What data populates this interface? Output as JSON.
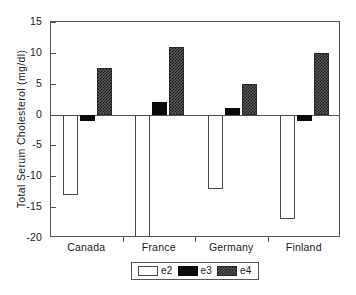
{
  "chart_data": {
    "type": "bar",
    "title": "",
    "subtitle": "",
    "xlabel": "",
    "ylabel": "Total Serum Cholesterol (mg/dl)",
    "categories": [
      "Canada",
      "France",
      "Germany",
      "Finland"
    ],
    "series": [
      {
        "name": "e2",
        "values": [
          -13,
          -22,
          -12,
          -17
        ]
      },
      {
        "name": "e3",
        "values": [
          -1,
          2,
          1,
          -1
        ]
      },
      {
        "name": "e4",
        "values": [
          7.5,
          11,
          5,
          10
        ]
      }
    ],
    "ylim": [
      -20,
      15
    ],
    "yticks": [
      15,
      10,
      5,
      0,
      -5,
      -10,
      -15,
      -20
    ],
    "ytick_labels": [
      "15",
      "10",
      "5",
      "0",
      "-5",
      "-10",
      "-15",
      "-20"
    ],
    "grid": false,
    "legend_position": "bottom-center"
  },
  "legend": {
    "entries": [
      {
        "label": "e2",
        "style": "open-white"
      },
      {
        "label": "e3",
        "style": "solid-black"
      },
      {
        "label": "e4",
        "style": "hatched-dark"
      }
    ]
  },
  "colors": {
    "axis": "#555555",
    "text": "#1a1a1a",
    "e2": "#ffffff",
    "e3": "#0a0a0a",
    "e4": "#5a5a5a",
    "background": "#ffffff"
  }
}
